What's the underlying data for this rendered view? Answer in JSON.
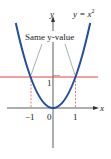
{
  "figure": {
    "function_label_lhs": "y = x",
    "function_label_exp": "2",
    "annotation": "Same y-value",
    "axes": {
      "x_label": "x",
      "y_label": "y",
      "x_ticks": [
        "−1",
        "0",
        "1"
      ],
      "y_ticks": [
        "1"
      ]
    },
    "colors": {
      "curve": "#1f4fa0",
      "horizontal_line": "#e0453a",
      "dashed": "#e0453a",
      "axes": "#333333",
      "leader": "#777777"
    }
  }
}
